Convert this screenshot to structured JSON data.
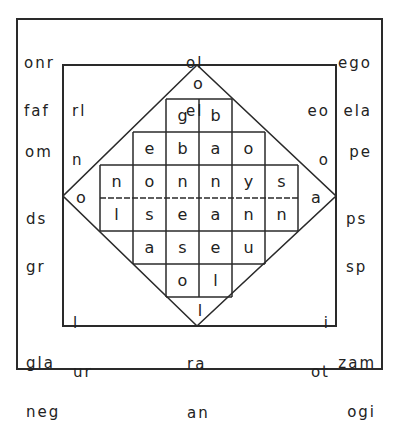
{
  "diagram": {
    "corners": {
      "outer_top_left": [
        "onr",
        "faf"
      ],
      "outer_top_center": [
        "ol",
        "el"
      ],
      "outer_top_right": [
        "ego",
        "ela"
      ],
      "outer_left": [
        "om"
      ],
      "outer_right": [
        "pe"
      ],
      "outer_mid_left": [
        "ds",
        "gr"
      ],
      "outer_mid_right": [
        "ps",
        "sp"
      ],
      "outer_bottom_left": [
        "gla",
        "neg"
      ],
      "outer_bottom_center": [
        "ra",
        "an"
      ],
      "outer_bottom_right": [
        "zam",
        "ogi"
      ],
      "inner_top_left": [
        "rl",
        "n"
      ],
      "inner_top_right": [
        "eo",
        "o"
      ],
      "inner_bottom_left": [
        "l",
        "ur"
      ],
      "inner_bottom_right": [
        "i",
        "ot"
      ]
    },
    "tips": {
      "top": "o",
      "left": "o",
      "right": "a",
      "bottom": "l"
    },
    "grid": [
      [
        "",
        "",
        "g",
        "b",
        "",
        ""
      ],
      [
        "",
        "e",
        "b",
        "a",
        "o",
        ""
      ],
      [
        "n",
        "o",
        "n",
        "n",
        "y",
        "s"
      ],
      [
        "l",
        "s",
        "e",
        "a",
        "n",
        "n"
      ],
      [
        "",
        "a",
        "s",
        "e",
        "u",
        ""
      ],
      [
        "",
        "",
        "o",
        "l",
        "",
        ""
      ]
    ]
  }
}
